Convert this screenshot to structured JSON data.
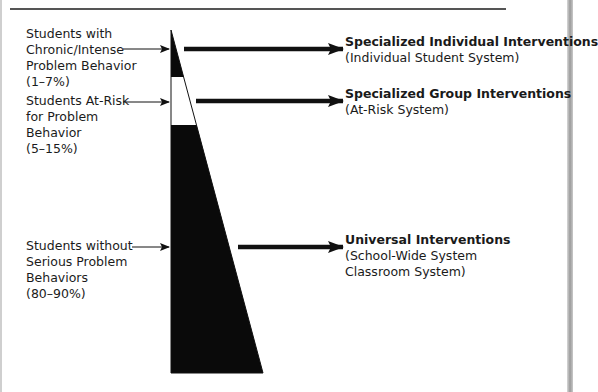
{
  "header": {
    "title_fragment": "pp"
  },
  "diagram": {
    "type": "triangle-tier",
    "colors": {
      "fill": "#0a0a0a",
      "line": "#111111",
      "background": "#ffffff"
    },
    "tiers": [
      {
        "group_label": [
          "Students with",
          "Chronic/Intense",
          "Problem Behavior",
          "(1–7%)"
        ],
        "group_range": "(1–7%)",
        "intervention_title": "Specialized Individual Interventions",
        "intervention_sub": [
          "(Individual Student System)"
        ],
        "band_fill": "black"
      },
      {
        "group_label": [
          "Students At-Risk",
          "for Problem",
          "Behavior",
          "(5–15%)"
        ],
        "group_range": "(5–15%)",
        "intervention_title": "Specialized Group Interventions",
        "intervention_sub": [
          "(At-Risk System)"
        ],
        "band_fill": "white"
      },
      {
        "group_label": [
          "Students without",
          "Serious Problem",
          "Behaviors",
          "(80–90%)"
        ],
        "group_range": "(80–90%)",
        "intervention_title": "Universal Interventions",
        "intervention_sub": [
          "(School-Wide System",
          "Classroom System)"
        ],
        "band_fill": "black"
      }
    ]
  }
}
